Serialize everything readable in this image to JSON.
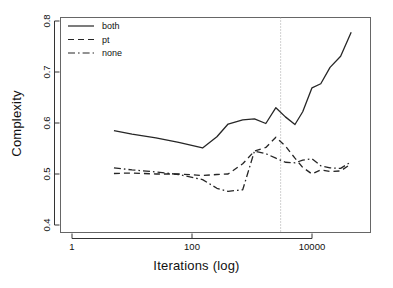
{
  "chart_data": {
    "type": "line",
    "title": "",
    "xlabel": "Iterations (log)",
    "ylabel": "Complexity",
    "xscale": "log",
    "xlim": [
      2,
      80000
    ],
    "ylim": [
      0.4,
      0.8
    ],
    "yticks": [
      0.4,
      0.5,
      0.6,
      0.7,
      0.8
    ],
    "ytick_labels": [
      "0.4",
      "0.5",
      "0.6",
      "0.7",
      "0.8"
    ],
    "xticks": [
      1,
      100,
      10000
    ],
    "xtick_labels": [
      "1",
      "100",
      "10000"
    ],
    "grid": false,
    "legend_position": "top-left",
    "legend": [
      "both",
      "pt",
      "none"
    ],
    "annotations": [
      {
        "name": "reference-line",
        "type": "vline",
        "x": 3000,
        "style": "dotted",
        "color": "#9a9a9a"
      }
    ],
    "series": [
      {
        "name": "both",
        "style": "solid",
        "color": "#262626",
        "x": [
          5,
          10,
          25,
          60,
          150,
          260,
          400,
          700,
          1100,
          1700,
          2500,
          3600,
          5200,
          7000,
          10000,
          14000,
          20000,
          30000,
          45000
        ],
        "values": [
          0.585,
          0.578,
          0.571,
          0.562,
          0.551,
          0.573,
          0.598,
          0.606,
          0.608,
          0.599,
          0.63,
          0.612,
          0.597,
          0.622,
          0.669,
          0.677,
          0.709,
          0.731,
          0.778
        ]
      },
      {
        "name": "pt",
        "style": "dashed",
        "color": "#262626",
        "x": [
          5,
          10,
          25,
          60,
          150,
          260,
          400,
          700,
          1100,
          1700,
          2500,
          3600,
          5200,
          7000,
          10000,
          14000,
          20000,
          30000,
          45000
        ],
        "values": [
          0.501,
          0.502,
          0.5,
          0.5,
          0.497,
          0.499,
          0.5,
          0.52,
          0.545,
          0.552,
          0.572,
          0.555,
          0.531,
          0.513,
          0.5,
          0.508,
          0.505,
          0.506,
          0.52
        ]
      },
      {
        "name": "none",
        "style": "dashdot",
        "color": "#262626",
        "x": [
          5,
          10,
          25,
          60,
          150,
          260,
          400,
          700,
          1100,
          1700,
          2500,
          3600,
          5200,
          7000,
          10000,
          14000,
          20000,
          30000,
          45000
        ],
        "values": [
          0.512,
          0.508,
          0.504,
          0.499,
          0.489,
          0.472,
          0.466,
          0.469,
          0.545,
          0.54,
          0.531,
          0.523,
          0.522,
          0.527,
          0.53,
          0.516,
          0.512,
          0.511,
          0.524
        ]
      }
    ]
  }
}
